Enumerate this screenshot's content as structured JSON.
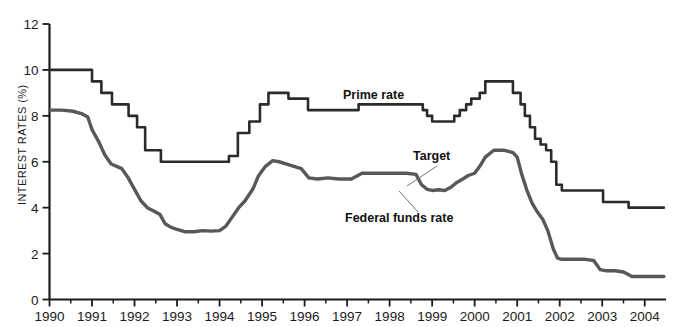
{
  "figure": {
    "top_rule": true,
    "background": "#ffffff",
    "axis_color": "#1b1b1b"
  },
  "chart_data": {
    "type": "line",
    "title": "",
    "xlabel": "",
    "ylabel": "INTEREST RATES (%)",
    "xlim": [
      1990,
      2004.5
    ],
    "ylim": [
      0,
      12
    ],
    "yticks": [
      0,
      2,
      4,
      6,
      8,
      10,
      12
    ],
    "ytick_labels": [
      "0",
      "2",
      "4",
      "6",
      "8",
      "10",
      "12"
    ],
    "xticks": [
      1990,
      1991,
      1992,
      1993,
      1994,
      1995,
      1996,
      1997,
      1998,
      1999,
      2000,
      2001,
      2002,
      2003,
      2004
    ],
    "xtick_labels": [
      "1990",
      "1991",
      "1992",
      "1993",
      "1994",
      "1995",
      "1996",
      "1997",
      "1998",
      "1999",
      "2000",
      "2001",
      "2002",
      "2003",
      "2004"
    ],
    "minor_xticks_per_interval": 1,
    "grid": false,
    "legend": "inline-annotations",
    "annotations": [
      {
        "name": "prime-rate-label",
        "text": "Prime rate",
        "x": 343,
        "y": 99,
        "leader": false
      },
      {
        "name": "target-label",
        "text": "Target",
        "x": 413,
        "y": 160,
        "leader": true,
        "leader_from": [
          437,
          166
        ],
        "leader_to": [
          407,
          186
        ]
      },
      {
        "name": "federal-funds-rate-label",
        "text": "Federal funds rate",
        "x": 345,
        "y": 222,
        "leader": true,
        "leader_from": [
          418,
          212
        ],
        "leader_to": [
          399,
          191
        ]
      }
    ],
    "series": [
      {
        "name": "Prime rate",
        "color": "#2b2b2b",
        "width": 2.6,
        "style": "step",
        "points": [
          [
            1990.0,
            10.0
          ],
          [
            1990.95,
            10.0
          ],
          [
            1991.0,
            9.5
          ],
          [
            1991.15,
            9.5
          ],
          [
            1991.22,
            9.0
          ],
          [
            1991.4,
            9.0
          ],
          [
            1991.47,
            8.5
          ],
          [
            1991.8,
            8.5
          ],
          [
            1991.86,
            8.0
          ],
          [
            1992.0,
            8.0
          ],
          [
            1992.06,
            7.5
          ],
          [
            1992.18,
            7.5
          ],
          [
            1992.25,
            6.5
          ],
          [
            1992.55,
            6.5
          ],
          [
            1992.62,
            6.0
          ],
          [
            1994.15,
            6.0
          ],
          [
            1994.22,
            6.25
          ],
          [
            1994.36,
            6.25
          ],
          [
            1994.43,
            7.25
          ],
          [
            1994.62,
            7.25
          ],
          [
            1994.7,
            7.75
          ],
          [
            1994.88,
            7.75
          ],
          [
            1994.95,
            8.5
          ],
          [
            1995.08,
            8.5
          ],
          [
            1995.15,
            9.0
          ],
          [
            1995.55,
            9.0
          ],
          [
            1995.62,
            8.75
          ],
          [
            1996.0,
            8.75
          ],
          [
            1996.08,
            8.25
          ],
          [
            1997.2,
            8.25
          ],
          [
            1997.27,
            8.5
          ],
          [
            1998.7,
            8.5
          ],
          [
            1998.78,
            8.25
          ],
          [
            1998.88,
            8.0
          ],
          [
            1999.0,
            7.75
          ],
          [
            1999.45,
            7.75
          ],
          [
            1999.52,
            8.0
          ],
          [
            1999.65,
            8.25
          ],
          [
            1999.8,
            8.5
          ],
          [
            1999.92,
            8.75
          ],
          [
            2000.05,
            8.75
          ],
          [
            2000.12,
            9.0
          ],
          [
            2000.25,
            9.5
          ],
          [
            2000.82,
            9.5
          ],
          [
            2000.9,
            9.0
          ],
          [
            2001.02,
            9.0
          ],
          [
            2001.08,
            8.5
          ],
          [
            2001.18,
            8.0
          ],
          [
            2001.3,
            7.5
          ],
          [
            2001.42,
            7.0
          ],
          [
            2001.55,
            6.75
          ],
          [
            2001.68,
            6.5
          ],
          [
            2001.8,
            6.0
          ],
          [
            2001.92,
            5.0
          ],
          [
            2002.05,
            4.75
          ],
          [
            2002.95,
            4.75
          ],
          [
            2003.02,
            4.25
          ],
          [
            2003.55,
            4.25
          ],
          [
            2003.62,
            4.0
          ],
          [
            2004.45,
            4.0
          ]
        ]
      },
      {
        "name": "Federal funds rate",
        "color": "#585858",
        "width": 3.4,
        "style": "smooth",
        "points": [
          [
            1990.0,
            8.25
          ],
          [
            1990.3,
            8.25
          ],
          [
            1990.55,
            8.2
          ],
          [
            1990.75,
            8.1
          ],
          [
            1990.9,
            7.95
          ],
          [
            1991.0,
            7.4
          ],
          [
            1991.15,
            6.9
          ],
          [
            1991.3,
            6.3
          ],
          [
            1991.45,
            5.9
          ],
          [
            1991.58,
            5.8
          ],
          [
            1991.7,
            5.7
          ],
          [
            1991.85,
            5.3
          ],
          [
            1992.0,
            4.8
          ],
          [
            1992.15,
            4.3
          ],
          [
            1992.3,
            4.0
          ],
          [
            1992.45,
            3.85
          ],
          [
            1992.6,
            3.7
          ],
          [
            1992.72,
            3.3
          ],
          [
            1992.85,
            3.15
          ],
          [
            1993.0,
            3.05
          ],
          [
            1993.2,
            2.95
          ],
          [
            1993.4,
            2.95
          ],
          [
            1993.6,
            3.0
          ],
          [
            1993.8,
            2.98
          ],
          [
            1994.0,
            3.0
          ],
          [
            1994.15,
            3.2
          ],
          [
            1994.3,
            3.6
          ],
          [
            1994.45,
            4.0
          ],
          [
            1994.6,
            4.3
          ],
          [
            1994.78,
            4.8
          ],
          [
            1994.92,
            5.4
          ],
          [
            1995.08,
            5.8
          ],
          [
            1995.25,
            6.05
          ],
          [
            1995.4,
            6.0
          ],
          [
            1995.58,
            5.9
          ],
          [
            1995.75,
            5.8
          ],
          [
            1995.92,
            5.7
          ],
          [
            1996.1,
            5.3
          ],
          [
            1996.3,
            5.25
          ],
          [
            1996.55,
            5.3
          ],
          [
            1996.8,
            5.25
          ],
          [
            1997.1,
            5.25
          ],
          [
            1997.35,
            5.5
          ],
          [
            1997.65,
            5.5
          ],
          [
            1997.9,
            5.5
          ],
          [
            1998.15,
            5.5
          ],
          [
            1998.4,
            5.5
          ],
          [
            1998.62,
            5.45
          ],
          [
            1998.75,
            5.0
          ],
          [
            1998.88,
            4.8
          ],
          [
            1999.0,
            4.75
          ],
          [
            1999.15,
            4.78
          ],
          [
            1999.3,
            4.75
          ],
          [
            1999.45,
            4.9
          ],
          [
            1999.58,
            5.1
          ],
          [
            1999.72,
            5.25
          ],
          [
            1999.85,
            5.4
          ],
          [
            2000.0,
            5.5
          ],
          [
            2000.12,
            5.8
          ],
          [
            2000.25,
            6.2
          ],
          [
            2000.45,
            6.5
          ],
          [
            2000.7,
            6.5
          ],
          [
            2000.9,
            6.4
          ],
          [
            2001.0,
            6.2
          ],
          [
            2001.1,
            5.5
          ],
          [
            2001.22,
            4.8
          ],
          [
            2001.35,
            4.2
          ],
          [
            2001.48,
            3.8
          ],
          [
            2001.6,
            3.5
          ],
          [
            2001.72,
            3.0
          ],
          [
            2001.85,
            2.2
          ],
          [
            2001.95,
            1.8
          ],
          [
            2002.05,
            1.75
          ],
          [
            2002.2,
            1.75
          ],
          [
            2002.4,
            1.75
          ],
          [
            2002.6,
            1.75
          ],
          [
            2002.8,
            1.7
          ],
          [
            2002.95,
            1.3
          ],
          [
            2003.1,
            1.25
          ],
          [
            2003.3,
            1.25
          ],
          [
            2003.5,
            1.2
          ],
          [
            2003.7,
            1.0
          ],
          [
            2003.9,
            1.0
          ],
          [
            2004.1,
            1.0
          ],
          [
            2004.3,
            1.0
          ],
          [
            2004.45,
            1.0
          ]
        ]
      }
    ]
  }
}
